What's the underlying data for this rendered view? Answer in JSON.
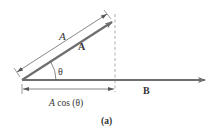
{
  "figure": {
    "caption": "(a)",
    "colors": {
      "vector": "#6e6e6e",
      "dimension": "#555555",
      "dashed": "#999999",
      "text": "#333333",
      "background": "#ffffff"
    },
    "vectors": [
      {
        "name": "A",
        "label": "A",
        "from": [
          22,
          80
        ],
        "to": [
          113,
          21
        ]
      },
      {
        "name": "B",
        "label": "B",
        "from": [
          22,
          80
        ],
        "to": [
          206,
          80
        ]
      }
    ],
    "angle_label": "θ",
    "magnitude_label": "A",
    "projection_label": "A cos (θ)"
  }
}
